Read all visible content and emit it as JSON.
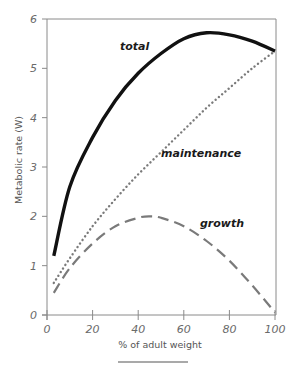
{
  "chart_data": {
    "type": "line",
    "title": "",
    "xlabel": "% of adult weight",
    "ylabel": "Metabolic rate (W)",
    "xlim": [
      0,
      100
    ],
    "ylim": [
      0,
      6
    ],
    "xticks": [
      0,
      20,
      40,
      60,
      80,
      100
    ],
    "yticks": [
      0,
      1,
      2,
      3,
      4,
      5,
      6
    ],
    "grid": false,
    "legend": "inline labels",
    "series": [
      {
        "name": "total",
        "style": "solid",
        "color": "#111111",
        "x": [
          3,
          10,
          20,
          30,
          40,
          50,
          60,
          70,
          80,
          90,
          100
        ],
        "values": [
          1.2,
          2.6,
          3.6,
          4.35,
          4.9,
          5.3,
          5.6,
          5.72,
          5.68,
          5.55,
          5.35
        ]
      },
      {
        "name": "maintenance",
        "style": "dotted",
        "color": "#777777",
        "x": [
          3,
          10,
          20,
          30,
          40,
          50,
          60,
          70,
          80,
          90,
          100
        ],
        "values": [
          0.65,
          1.15,
          1.8,
          2.35,
          2.85,
          3.3,
          3.75,
          4.2,
          4.6,
          5.0,
          5.35
        ]
      },
      {
        "name": "growth",
        "style": "dashed",
        "color": "#777777",
        "x": [
          3,
          10,
          20,
          30,
          40,
          45,
          50,
          60,
          70,
          80,
          90,
          100
        ],
        "values": [
          0.45,
          0.95,
          1.45,
          1.8,
          1.97,
          2.0,
          1.97,
          1.8,
          1.5,
          1.1,
          0.6,
          0.05
        ]
      }
    ]
  },
  "labels": {
    "total": "total",
    "maintenance": "maintenance",
    "growth": "growth",
    "xlabel": "% of adult weight",
    "ylabel": "Metabolic rate (W)"
  },
  "ticks": {
    "x": [
      "0",
      "20",
      "40",
      "60",
      "80",
      "100"
    ],
    "y": [
      "0",
      "1",
      "2",
      "3",
      "4",
      "5",
      "6"
    ]
  }
}
